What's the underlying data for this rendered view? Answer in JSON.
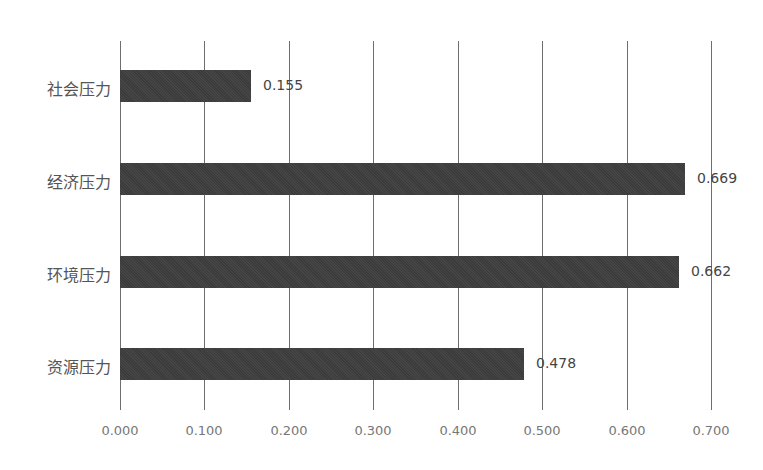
{
  "chart_data": {
    "type": "bar",
    "orientation": "horizontal",
    "title": "",
    "xlabel": "",
    "ylabel": "",
    "categories": [
      "社会压力",
      "经济压力",
      "环境压力",
      "资源压力"
    ],
    "values": [
      0.155,
      0.669,
      0.662,
      0.478
    ],
    "value_labels": [
      "0.155",
      "0.669",
      "0.662",
      "0.478"
    ],
    "xlim": [
      0,
      0.7
    ],
    "x_ticks": [
      "0.000",
      "0.100",
      "0.200",
      "0.300",
      "0.400",
      "0.500",
      "0.600",
      "0.700"
    ],
    "grid": "vertical",
    "legend": "none",
    "bar_color": "#3e3e3e"
  }
}
